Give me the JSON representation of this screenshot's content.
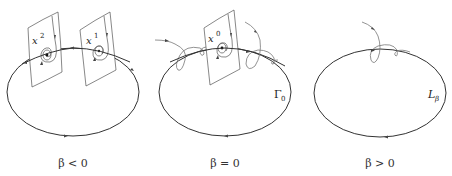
{
  "panels": [
    {
      "id": "beta-negative",
      "caption": "β < 0",
      "fixed_points": [
        {
          "name": "x",
          "superscript": "2"
        },
        {
          "name": "x",
          "superscript": "1"
        }
      ],
      "orbit_label": null
    },
    {
      "id": "beta-zero",
      "caption": "β = 0",
      "fixed_points": [
        {
          "name": "x",
          "superscript": "0"
        }
      ],
      "orbit_label": {
        "main": "Γ",
        "subscript": "0"
      }
    },
    {
      "id": "beta-positive",
      "caption": "β > 0",
      "fixed_points": [],
      "orbit_label": {
        "main": "L",
        "subscript": "β"
      }
    }
  ],
  "colors": {
    "orbit": "#333333",
    "surface": "#555555",
    "trajectory": "#777777",
    "text": "#222222"
  }
}
